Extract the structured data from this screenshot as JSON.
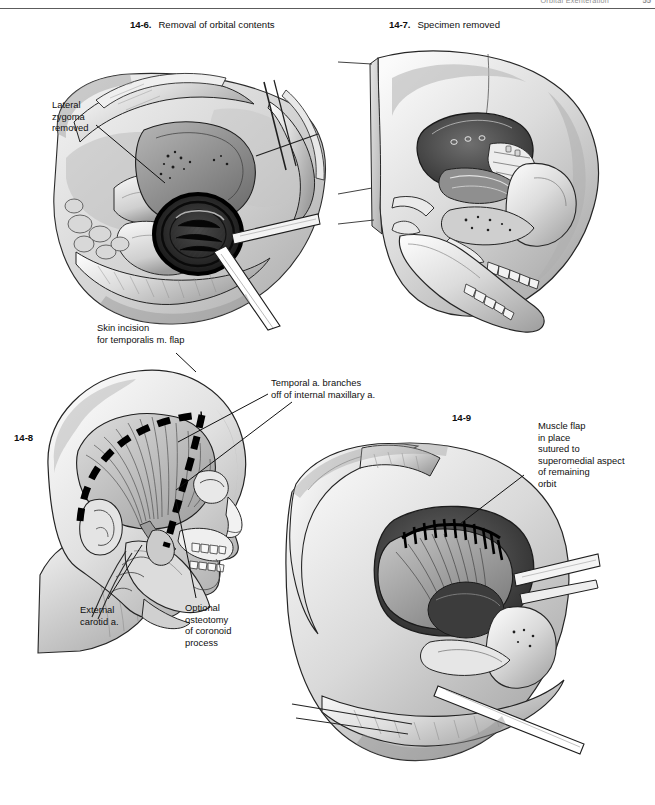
{
  "page": {
    "running_head": "Orbital Exenteration",
    "folio": "55",
    "background": "#ffffff",
    "ink": "#111111"
  },
  "figures": [
    {
      "id": "fig-14-6",
      "number": "14-6.",
      "caption": "Removal of orbital contents",
      "description": "Grayscale pen-and-ink surgical illustration: exposed right orbit during exenteration, with retractors holding back the soft-tissue flaps, the periorbita and orbital contents being delivered, and a suction/cautery instrument entering the orbital apex."
    },
    {
      "id": "fig-14-7",
      "number": "14-7.",
      "caption": "Specimen removed",
      "description": "Grayscale illustration of the lateral skull after the orbital specimen has been removed, showing the empty bony orbit, maxillary sinus, nasal cavity and dentition in sagittal cut-away."
    },
    {
      "id": "fig-14-8",
      "number": "14-8",
      "caption": "",
      "description": "Lateral head profile showing the temporalis muscle beneath the scalp, the dashed hemicoronal skin incision for the temporalis muscle flap, the external carotid artery in the neck and the coronoid process of the mandible."
    },
    {
      "id": "fig-14-9",
      "number": "14-9",
      "caption": "",
      "description": "Grayscale illustration of the orbital defect with the temporalis muscle flap transposed into the orbit and sutured along the superomedial orbital rim."
    }
  ],
  "annotations": [
    {
      "id": "lateral-zygoma-removed",
      "text": "Lateral\nzygoma\nremoved",
      "figure": "fig-14-6"
    },
    {
      "id": "skin-incision-temporalis-flap",
      "text": "Skin incision\nfor temporalis m. flap",
      "figure": "fig-14-8"
    },
    {
      "id": "temporal-artery-branches",
      "text": "Temporal a. branches\noff of internal maxillary a.",
      "figure": "fig-14-8"
    },
    {
      "id": "external-carotid-artery",
      "text": "External\ncarotid a.",
      "figure": "fig-14-8"
    },
    {
      "id": "optional-osteotomy-coronoid",
      "text": "Optional\nosteotomy\nof coronoid\nprocess",
      "figure": "fig-14-8"
    },
    {
      "id": "muscle-flap-in-place",
      "text": "Muscle flap\nin place\nsutured to\nsuperomedial aspect\nof remaining\norbit",
      "figure": "fig-14-9"
    }
  ]
}
